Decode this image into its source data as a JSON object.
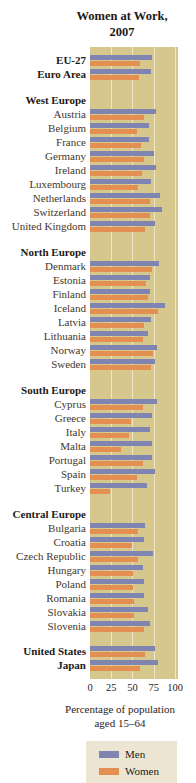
{
  "title": {
    "line1": "Women at Work,",
    "line2": "2007"
  },
  "axis": {
    "ticks": [
      "0",
      "25",
      "50",
      "75",
      "100"
    ],
    "caption_line1": "Percentage of population",
    "caption_line2": "aged 15–64"
  },
  "legend": {
    "men_label": "Men",
    "women_label": "Women"
  },
  "colors": {
    "men": "#8084b0",
    "women": "#e28f51",
    "plot_background": "#d6c78d",
    "gridline": "#eee6c4",
    "legend_background": "#ebe5d2",
    "country_label": "#44372a",
    "header_label": "#1e1a16"
  },
  "chart_data": {
    "type": "bar",
    "orientation": "horizontal",
    "title": "Women at Work, 2007",
    "xlabel": "Percentage of population aged 15–64",
    "xlim": [
      0,
      100
    ],
    "xticks": [
      0,
      25,
      50,
      75,
      100
    ],
    "grid": true,
    "legend_position": "bottom",
    "series_names": [
      "Men",
      "Women"
    ],
    "groups": [
      {
        "header": null,
        "bold": true,
        "rows": [
          {
            "label": "EU-27",
            "men": 73,
            "women": 59
          },
          {
            "label": "Euro Area",
            "men": 72,
            "women": 58
          }
        ]
      },
      {
        "header": "West Europe",
        "bold": false,
        "rows": [
          {
            "label": "Austria",
            "men": 78,
            "women": 64
          },
          {
            "label": "Belgium",
            "men": 69,
            "women": 55
          },
          {
            "label": "France",
            "men": 69,
            "women": 60
          },
          {
            "label": "Germany",
            "men": 75,
            "women": 64
          },
          {
            "label": "Ireland",
            "men": 77,
            "women": 61
          },
          {
            "label": "Luxembourg",
            "men": 72,
            "women": 56
          },
          {
            "label": "Netherlands",
            "men": 82,
            "women": 70
          },
          {
            "label": "Switzerland",
            "men": 85,
            "women": 71
          },
          {
            "label": "United Kingdom",
            "men": 76,
            "women": 65
          }
        ]
      },
      {
        "header": "North Europe",
        "bold": false,
        "rows": [
          {
            "label": "Denmark",
            "men": 81,
            "women": 73
          },
          {
            "label": "Estonia",
            "men": 71,
            "women": 66
          },
          {
            "label": "Finland",
            "men": 71,
            "women": 68
          },
          {
            "label": "Iceland",
            "men": 88,
            "women": 80
          },
          {
            "label": "Latvia",
            "men": 72,
            "women": 64
          },
          {
            "label": "Lithuania",
            "men": 68,
            "women": 62
          },
          {
            "label": "Norway",
            "men": 79,
            "women": 74
          },
          {
            "label": "Sweden",
            "men": 76,
            "women": 72
          }
        ]
      },
      {
        "header": "South Europe",
        "bold": false,
        "rows": [
          {
            "label": "Cyprus",
            "men": 79,
            "women": 62
          },
          {
            "label": "Greece",
            "men": 73,
            "women": 48
          },
          {
            "label": "Italy",
            "men": 70,
            "women": 46
          },
          {
            "label": "Malta",
            "men": 73,
            "women": 36
          },
          {
            "label": "Portugal",
            "men": 73,
            "women": 62
          },
          {
            "label": "Spain",
            "men": 76,
            "women": 55
          },
          {
            "label": "Turkey",
            "men": 67,
            "women": 23
          }
        ]
      },
      {
        "header": "Central Europe",
        "bold": false,
        "rows": [
          {
            "label": "Bulgaria",
            "men": 65,
            "women": 57
          },
          {
            "label": "Croatia",
            "men": 63,
            "women": 49
          },
          {
            "label": "Czech Republic",
            "men": 74,
            "women": 56
          },
          {
            "label": "Hungary",
            "men": 62,
            "women": 50
          },
          {
            "label": "Poland",
            "men": 63,
            "women": 50
          },
          {
            "label": "Romania",
            "men": 64,
            "women": 52
          },
          {
            "label": "Slovakia",
            "men": 68,
            "women": 52
          },
          {
            "label": "Slovenia",
            "men": 71,
            "women": 63
          }
        ]
      },
      {
        "header": null,
        "bold": true,
        "rows": [
          {
            "label": "United States",
            "men": 76,
            "women": 65
          },
          {
            "label": "Japan",
            "men": 80,
            "women": 59
          }
        ]
      }
    ]
  }
}
